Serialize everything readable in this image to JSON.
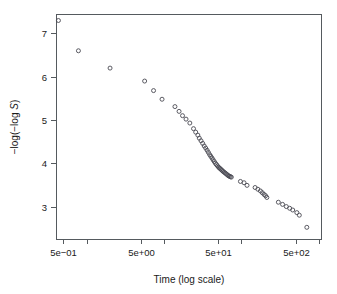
{
  "chart_data": {
    "type": "scatter",
    "title": "",
    "subtitle": "",
    "xlabel": "Time (log scale)",
    "ylabel": "-log(-log S)",
    "ylabel_parts": {
      "pre": "−log(−log ",
      "italic": "S",
      "post": ")"
    },
    "xscale": "log",
    "yscale": "linear",
    "xlim": [
      0.4,
      1100
    ],
    "ylim": [
      2.25,
      7.45
    ],
    "grid": false,
    "legend": null,
    "legend_position": "none",
    "marker": "open-circle",
    "marker_size": 3.2,
    "xticks_labeled": [
      {
        "value": 0.5,
        "label": "5e−01"
      },
      {
        "value": 5,
        "label": "5e+00"
      },
      {
        "value": 50,
        "label": "5e+01"
      },
      {
        "value": 500,
        "label": "5e+02"
      }
    ],
    "xticks_minor": [
      {
        "value": 1,
        "label": ""
      },
      {
        "value": 10,
        "label": ""
      },
      {
        "value": 100,
        "label": ""
      },
      {
        "value": 1000,
        "label": ""
      }
    ],
    "yticks": [
      {
        "value": 7,
        "label": "7"
      },
      {
        "value": 6,
        "label": "6"
      },
      {
        "value": 5,
        "label": "5"
      },
      {
        "value": 4,
        "label": "4"
      },
      {
        "value": 3,
        "label": "3"
      }
    ],
    "x": [
      0.43,
      0.78,
      2.0,
      5.6,
      7.3,
      9.4,
      13.8,
      15.6,
      17.3,
      19.2,
      21.5,
      24.0,
      25.6,
      27.3,
      28.5,
      30.0,
      31.5,
      33.0,
      34.5,
      36.0,
      37.4,
      38.8,
      40.2,
      41.6,
      43.0,
      44.5,
      46.0,
      47.5,
      49.0,
      50.5,
      52.0,
      53.5,
      55.0,
      56.5,
      58.0,
      60.0,
      62.0,
      64.0,
      66.0,
      68.0,
      70.0,
      72.0,
      74.0,
      97.0,
      108.0,
      118.0,
      150.0,
      163.0,
      176.0,
      186.0,
      196.0,
      205.0,
      213.0,
      300.0,
      340.0,
      380.0,
      420.0,
      460.0,
      520.0,
      560.0,
      700.0
    ],
    "y": [
      7.3,
      6.6,
      6.2,
      5.9,
      5.68,
      5.48,
      5.31,
      5.2,
      5.1,
      5.02,
      4.93,
      4.8,
      4.72,
      4.65,
      4.58,
      4.52,
      4.46,
      4.4,
      4.35,
      4.3,
      4.25,
      4.2,
      4.16,
      4.12,
      4.08,
      4.04,
      4.0,
      3.97,
      3.94,
      3.91,
      3.89,
      3.87,
      3.85,
      3.83,
      3.81,
      3.79,
      3.77,
      3.75,
      3.73,
      3.71,
      3.7,
      3.69,
      3.68,
      3.58,
      3.55,
      3.49,
      3.44,
      3.4,
      3.36,
      3.32,
      3.28,
      3.25,
      3.21,
      3.1,
      3.05,
      3.0,
      2.96,
      2.92,
      2.86,
      2.8,
      2.52
    ],
    "n_points": 61
  },
  "axes": {
    "frame": {
      "left": 56,
      "right": 322,
      "top": 14,
      "bottom": 239
    }
  }
}
